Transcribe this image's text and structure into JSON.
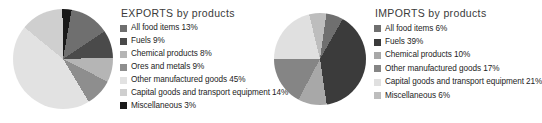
{
  "chart_data": [
    {
      "type": "pie",
      "title": "EXPORTS by products",
      "xlabel": "",
      "ylabel": "",
      "legend_position": "right",
      "grid": false,
      "unit": "%",
      "categories": [
        "All food items",
        "Fuels",
        "Chemical products",
        "Ores and metals",
        "Other manufactured goods",
        "Capital goods and transport equipment",
        "Miscellaneous"
      ],
      "values": [
        13,
        9,
        8,
        9,
        45,
        14,
        3
      ],
      "colors": [
        "#6f6f6f",
        "#4a4a4a",
        "#b5b5b5",
        "#8e8e8e",
        "#e2e2e2",
        "#cfcfcf",
        "#1a1a1a"
      ],
      "legend_entries": [
        {
          "label": "All food items 13%",
          "name": "All food items",
          "value": 13,
          "color": "#6f6f6f"
        },
        {
          "label": "Fuels 9%",
          "name": "Fuels",
          "value": 9,
          "color": "#4a4a4a"
        },
        {
          "label": "Chemical products 8%",
          "name": "Chemical products",
          "value": 8,
          "color": "#b5b5b5"
        },
        {
          "label": "Ores and metals 9%",
          "name": "Ores and metals",
          "value": 9,
          "color": "#8e8e8e"
        },
        {
          "label": "Other manufactured goods 45%",
          "name": "Other manufactured goods",
          "value": 45,
          "color": "#e2e2e2"
        },
        {
          "label": "Capital goods and transport equipment 14%",
          "name": "Capital goods and transport equipment",
          "value": 14,
          "color": "#cfcfcf"
        },
        {
          "label": "Miscellaneous 3%",
          "name": "Miscellaneous",
          "value": 3,
          "color": "#1a1a1a"
        }
      ]
    },
    {
      "type": "pie",
      "title": "IMPORTS by products",
      "xlabel": "",
      "ylabel": "",
      "legend_position": "right",
      "grid": false,
      "unit": "%",
      "categories": [
        "All food items",
        "Fuels",
        "Chemical products",
        "Other manufactured goods",
        "Capital goods and transport equipment",
        "Miscellaneous"
      ],
      "values": [
        6,
        39,
        10,
        17,
        21,
        6
      ],
      "colors": [
        "#6f6f6f",
        "#3b3b3b",
        "#a8a8a8",
        "#858585",
        "#e0e0e0",
        "#bdbdbd"
      ],
      "legend_entries": [
        {
          "label": "All food items 6%",
          "name": "All food items",
          "value": 6,
          "color": "#6f6f6f"
        },
        {
          "label": "Fuels 39%",
          "name": "Fuels",
          "value": 39,
          "color": "#3b3b3b"
        },
        {
          "label": "Chemical products 10%",
          "name": "Chemical products",
          "value": 10,
          "color": "#a8a8a8"
        },
        {
          "label": "Other manufactured goods 17%",
          "name": "Other manufactured goods",
          "value": 17,
          "color": "#858585"
        },
        {
          "label": "Capital goods and transport equipment 21%",
          "name": "Capital goods and transport equipment",
          "value": 21,
          "color": "#e0e0e0"
        },
        {
          "label": "Miscellaneous 6%",
          "name": "Miscellaneous",
          "value": 6,
          "color": "#bdbdbd"
        }
      ]
    }
  ]
}
